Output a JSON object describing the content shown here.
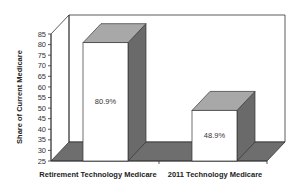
{
  "chart_data": {
    "type": "bar",
    "style": "3d",
    "title": "",
    "xlabel": "",
    "ylabel": "Share of Current Medicare",
    "ylim": [
      25,
      85
    ],
    "yticks": [
      25,
      30,
      35,
      40,
      45,
      50,
      55,
      60,
      65,
      70,
      75,
      80,
      85
    ],
    "categories": [
      "Retirement Technology Medicare",
      "2011 Technology Medicare"
    ],
    "values": [
      80.9,
      48.9
    ],
    "data_labels": [
      "80.9%",
      "48.9%"
    ],
    "grid": false,
    "legend": null,
    "colors": {
      "bar_front": "#ffffff",
      "bar_top": "#a8a8a8",
      "bar_side": "#6a6a6a",
      "floor": "#6e6e6e",
      "wall": "#ffffff",
      "outline": "#333333"
    }
  }
}
